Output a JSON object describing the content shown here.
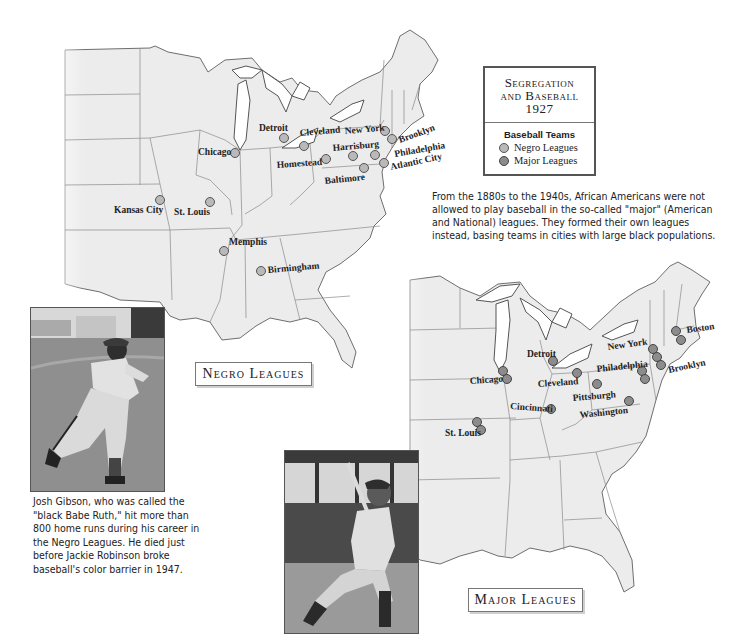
{
  "title": {
    "line1": "Segregation",
    "line2": "and Baseball",
    "line3": "1927"
  },
  "legend": {
    "heading": "Baseball Teams",
    "items": [
      {
        "label": "Negro Leagues",
        "marker": "baseball-icon-light",
        "color": "#b9b9b9"
      },
      {
        "label": "Major Leagues",
        "marker": "baseball-icon-dark",
        "color": "#8c8c8c"
      }
    ]
  },
  "intro_text": "From the 1880s to the 1940s, African Americans were not allowed to play baseball in the so-called \"major\" (American and National) leagues. They formed their own leagues instead, basing teams in cities with large black populations.",
  "maps": {
    "negro": {
      "label": "Negro Leagues",
      "cities": [
        "Detroit",
        "Cleveland",
        "New York",
        "Brooklyn",
        "Chicago",
        "Harrisburg",
        "Philadelphia",
        "Homestead",
        "Atlantic City",
        "Baltimore",
        "Kansas City",
        "St. Louis",
        "Memphis",
        "Birmingham"
      ]
    },
    "major": {
      "label": "Major Leagues",
      "cities": [
        "Boston",
        "New York",
        "Brooklyn",
        "Detroit",
        "Philadelphia",
        "Chicago",
        "Cleveland",
        "Cincinnati",
        "Pittsburgh",
        "Washington",
        "St. Louis"
      ]
    }
  },
  "photos": {
    "gibson": {
      "subject": "Josh Gibson throwing"
    },
    "ruth": {
      "subject": "Babe Ruth batting"
    }
  },
  "caption": "Josh Gibson, who was called the \"black Babe Ruth,\" hit more than 800 home runs during his career in the Negro Leagues. He died just before Jackie Robinson broke baseball's color barrier in 1947."
}
